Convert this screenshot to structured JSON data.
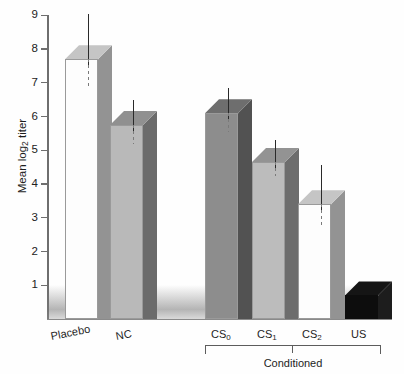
{
  "chart_data": {
    "type": "bar",
    "title": "",
    "subtitle": "",
    "xlabel": "",
    "ylabel": "Mean log2 titer",
    "ylabel_parts": {
      "pre": "Mean log",
      "sub": "2",
      "post": " titer"
    },
    "ylim": [
      0,
      9.2
    ],
    "yticks": [
      1,
      2,
      3,
      4,
      5,
      6,
      7,
      8,
      9
    ],
    "ytick_labels": [
      "1",
      "2",
      "3",
      "4",
      "5",
      "6",
      "7",
      "8",
      "9"
    ],
    "grid": false,
    "legend": "none",
    "style": "3d-bar",
    "categories": [
      "Placebo",
      "NC",
      "CS0",
      "CS1",
      "CS2",
      "US"
    ],
    "category_labels": [
      "Placebo",
      "NC",
      "CS",
      "CS",
      "CS",
      "US"
    ],
    "category_subscripts": [
      "",
      "",
      "0",
      "1",
      "2",
      ""
    ],
    "values": [
      7.7,
      5.75,
      6.1,
      4.65,
      3.4,
      0.7
    ],
    "error_upper": [
      9.05,
      6.5,
      6.85,
      5.3,
      4.55,
      0.7
    ],
    "error_lower": [
      6.85,
      5.2,
      5.55,
      4.25,
      2.75,
      0.7
    ],
    "bar_face_colors": [
      "#fdfdfd",
      "#b9b9b9",
      "#8d8d8d",
      "#bcbcbc",
      "#fdfdfd",
      "#0d0d0d"
    ],
    "annotations": [
      {
        "text": "Conditioned",
        "type": "group-bracket",
        "members": [
          "CS0",
          "CS1",
          "CS2",
          "US"
        ]
      }
    ]
  },
  "axis": {
    "y_title": "Mean log2 titer",
    "tick_values": [
      "9",
      "8",
      "7",
      "6",
      "5",
      "4",
      "3",
      "2",
      "1"
    ]
  },
  "bracket": {
    "label": "Conditioned"
  },
  "colors": {
    "axis": "#6e6e6e",
    "error_bar": "#2a2a2a",
    "bracket": "#5d5d5d",
    "text": "#1d1d1d",
    "background": "#fefefe"
  }
}
